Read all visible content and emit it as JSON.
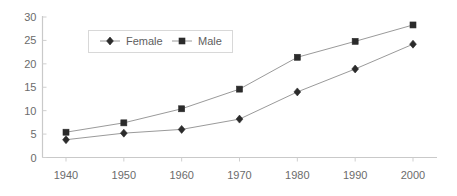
{
  "chart_data": {
    "type": "line",
    "title": "",
    "subtitle": "",
    "xlabel": "",
    "ylabel": "",
    "categories": [
      "1940",
      "1950",
      "1960",
      "1970",
      "1980",
      "1990",
      "2000"
    ],
    "x": [
      1940,
      1950,
      1960,
      1970,
      1980,
      1990,
      2000
    ],
    "xlim": [
      1935,
      2005
    ],
    "ylim": [
      0,
      30
    ],
    "y_ticks": [
      "0",
      "5",
      "10",
      "15",
      "20",
      "25",
      "30"
    ],
    "y_tick_values": [
      0,
      5,
      10,
      15,
      20,
      25,
      30
    ],
    "grid": false,
    "legend_position": "top-left-inside",
    "series": [
      {
        "name": "Female",
        "marker": "diamond",
        "color": "#2b2b2b",
        "line_color": "#9a9a9a",
        "values": [
          3.8,
          5.2,
          6.0,
          8.2,
          14.0,
          18.9,
          24.2
        ]
      },
      {
        "name": "Male",
        "marker": "square",
        "color": "#2b2b2b",
        "line_color": "#9a9a9a",
        "values": [
          5.4,
          7.4,
          10.4,
          14.6,
          21.4,
          24.8,
          28.3
        ]
      }
    ],
    "annotations": []
  },
  "legend": {
    "entries": [
      {
        "label": "Female",
        "marker": "diamond"
      },
      {
        "label": "Male",
        "marker": "square"
      }
    ]
  },
  "colors": {
    "background": "#ffffff",
    "axis": "#c9c9c9",
    "tick_text": "#6b6b6b",
    "series_line": "#9a9a9a",
    "marker": "#2b2b2b",
    "legend_border": "#d8d8d8"
  }
}
